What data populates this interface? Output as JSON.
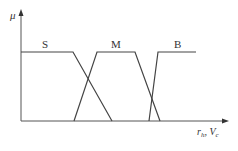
{
  "diagram": {
    "y_axis_label": "μ",
    "x_axis_label": {
      "part1_main": "r",
      "part1_sub": "h",
      "separator": ",",
      "part2_main": "V",
      "part2_sub": "c"
    },
    "sets": [
      {
        "label": "S",
        "points": [
          [
            21,
            52
          ],
          [
            73,
            52
          ],
          [
            112,
            121
          ]
        ]
      },
      {
        "label": "M",
        "points": [
          [
            74,
            121
          ],
          [
            97,
            52
          ],
          [
            135,
            52
          ],
          [
            160,
            121
          ]
        ]
      },
      {
        "label": "B",
        "points": [
          [
            149,
            121
          ],
          [
            158,
            52
          ],
          [
            196,
            52
          ]
        ]
      }
    ],
    "line_color": "#444444"
  }
}
